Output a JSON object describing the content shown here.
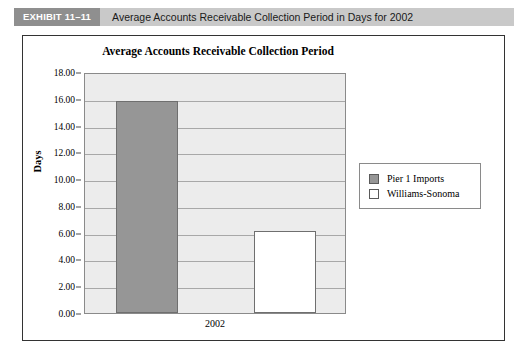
{
  "exhibit": {
    "tag": "EXHIBIT 11–11",
    "title": "Average Accounts Receivable Collection Period in Days for 2002"
  },
  "chart_data": {
    "type": "bar",
    "title": "Average Accounts Receivable Collection Period",
    "xlabel": "",
    "ylabel": "Days",
    "categories": [
      "2002"
    ],
    "series": [
      {
        "name": "Pier 1 Imports",
        "values": [
          15.8
        ],
        "color": "#969696"
      },
      {
        "name": "Williams-Sonoma",
        "values": [
          6.1
        ],
        "color": "#ffffff"
      }
    ],
    "ylim": [
      0.0,
      18.0
    ],
    "ytick_step": 2.0,
    "ytick_labels": [
      "18.00",
      "16.00",
      "14.00",
      "12.00",
      "10.00",
      "8.00",
      "6.00",
      "4.00",
      "2.00",
      "0.00"
    ],
    "ytick_values": [
      18.0,
      16.0,
      14.0,
      12.0,
      10.0,
      8.0,
      6.0,
      4.0,
      2.0,
      0.0
    ],
    "grid": true,
    "legend_position": "right",
    "plot_background": "#ececec",
    "gridline_color": "#a8a8a8"
  },
  "legend": {
    "items": [
      {
        "label": "Pier 1 Imports"
      },
      {
        "label": "Williams-Sonoma"
      }
    ]
  }
}
